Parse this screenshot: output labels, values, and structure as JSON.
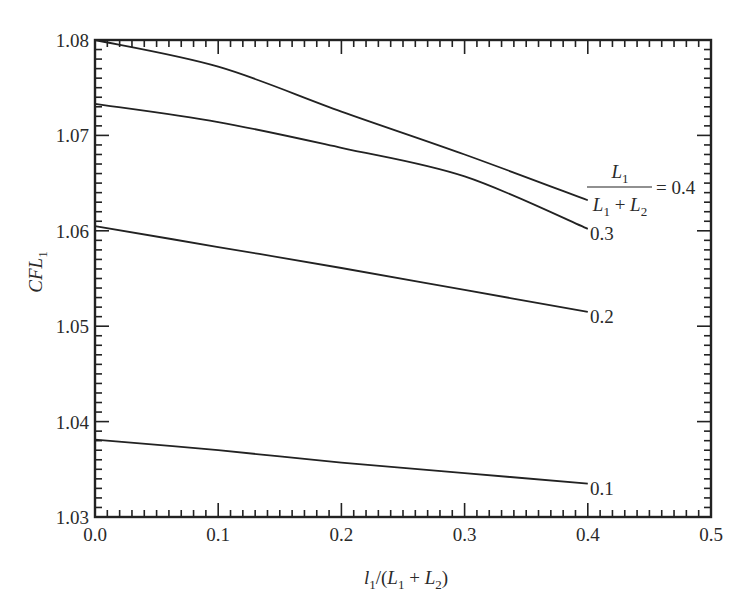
{
  "chart_data": {
    "type": "line",
    "title": "",
    "xlabel": "l1/(L1 + L2)",
    "ylabel": "CFL1",
    "xlim": [
      0.0,
      0.5
    ],
    "ylim": [
      1.03,
      1.08
    ],
    "grid": false,
    "legend_position": "inline labels at right end of curves",
    "x_ticks": [
      "0.0",
      "0.1",
      "0.2",
      "0.3",
      "0.4",
      "0.5"
    ],
    "y_ticks": [
      "1.03",
      "1.04",
      "1.05",
      "1.06",
      "1.07",
      "1.08"
    ],
    "x_minor_step": 0.01,
    "y_minor_step": 0.001,
    "x": [
      0.0,
      0.1,
      0.2,
      0.3,
      0.4
    ],
    "series": [
      {
        "name": "L1/(L1 + L2) = 0.4",
        "label": "0.4",
        "values": [
          1.08,
          1.0772,
          1.0725,
          1.068,
          1.0632
        ]
      },
      {
        "name": "0.3",
        "label": "0.3",
        "values": [
          1.0733,
          1.0714,
          1.0687,
          1.0657,
          1.0602
        ]
      },
      {
        "name": "0.2",
        "label": "0.2",
        "values": [
          1.0605,
          1.0583,
          1.0561,
          1.0538,
          1.0515
        ]
      },
      {
        "name": "0.1",
        "label": "0.1",
        "values": [
          1.0381,
          1.037,
          1.0357,
          1.0346,
          1.0335
        ]
      }
    ],
    "legend_annotation": {
      "numerator": "L1",
      "denominator": "L1 + L2",
      "equals": "= 0.4"
    }
  },
  "labels": {
    "xlabel_l": "l",
    "xlabel_sub1": "1",
    "xlabel_mid": "/(L",
    "xlabel_sub2": "1",
    "xlabel_plus": " + L",
    "xlabel_sub3": "2",
    "xlabel_end": ")",
    "ylabel_main": "CFL",
    "ylabel_sub": "1",
    "legend_num": "L",
    "legend_num_sub": "1",
    "legend_den_a": "L",
    "legend_den_a_sub": "1",
    "legend_den_plus": " + L",
    "legend_den_b_sub": "2",
    "legend_eq": "= 0.4",
    "curve_03": "0.3",
    "curve_02": "0.2",
    "curve_01": "0.1"
  }
}
